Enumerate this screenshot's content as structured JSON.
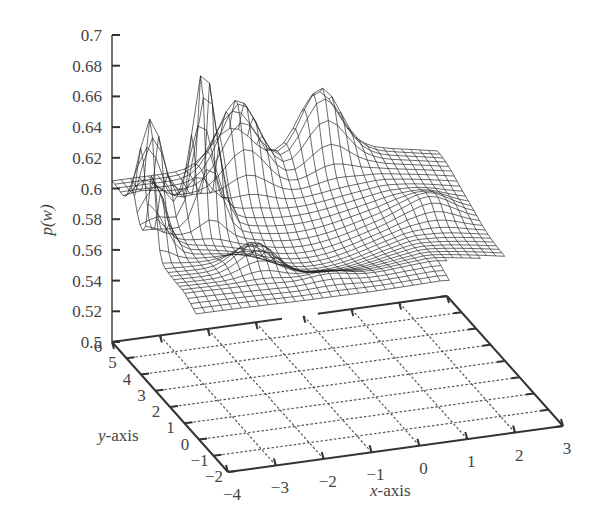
{
  "chart_data": {
    "type": "surface3d",
    "title": "",
    "zlabel": "p(w)",
    "xlabel": "x-axis",
    "ylabel": "y-axis",
    "xlim": [
      -4,
      3
    ],
    "ylim": [
      -2,
      6
    ],
    "zlim": [
      0.5,
      0.7
    ],
    "xticks": [
      -4,
      -3,
      -2,
      -1,
      0,
      1,
      2,
      3
    ],
    "yticks": [
      -2,
      -1,
      0,
      1,
      2,
      3,
      4,
      5,
      6
    ],
    "zticks": [
      0.5,
      0.52,
      0.54,
      0.56,
      0.58,
      0.6,
      0.62,
      0.64,
      0.66,
      0.68,
      0.7
    ],
    "zticklabels": [
      "0.5",
      "0.52",
      "0.54",
      "0.56",
      "0.58",
      "0.6",
      "0.62",
      "0.64",
      "0.66",
      "0.68",
      "0.7"
    ],
    "grid": "floor dashed grid, x and y unit spacing",
    "surface": {
      "description": "Wireframe mesh of p(w) over x-y plane; baseline around 0.56-0.60 with a valley; sharp spikes near x=-2.6,y=4 (~0.69), x=-3.6,y=4.5 (~0.65), x=-3.9,y=3 (~0.64), and a ridge at the back reaching ~0.63-0.65; trailing low tail near x=2.5,y=1 (~0.58).",
      "x_range": [
        -4,
        3
      ],
      "y_range": [
        -2,
        6
      ],
      "approx_base_level": 0.58,
      "peaks": [
        {
          "x": -2.6,
          "y": 4.2,
          "z": 0.69
        },
        {
          "x": -3.6,
          "y": 4.6,
          "z": 0.65
        },
        {
          "x": -4.0,
          "y": 3.2,
          "z": 0.64
        },
        {
          "x": -1.5,
          "y": 5.5,
          "z": 0.64
        },
        {
          "x": 0.3,
          "y": 5.8,
          "z": 0.635
        },
        {
          "x": 1.9,
          "y": 3.5,
          "z": 0.6
        },
        {
          "x": -2.2,
          "y": 2.0,
          "z": 0.61
        },
        {
          "x": -1.0,
          "y": 1.2,
          "z": 0.595
        }
      ]
    }
  },
  "labels": {
    "zlabel": "p(w)",
    "xlabel": "x-axis",
    "ylabel": "y-axis"
  }
}
